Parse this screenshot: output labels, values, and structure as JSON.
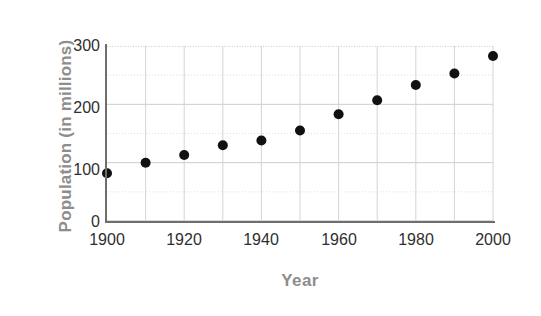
{
  "chart_data": {
    "type": "scatter",
    "title": "",
    "xlabel": "Year",
    "ylabel": "Population (in millions)",
    "x": [
      1900,
      1910,
      1920,
      1930,
      1940,
      1950,
      1960,
      1970,
      1980,
      1990,
      2000
    ],
    "values": [
      82,
      100,
      113,
      130,
      138,
      155,
      183,
      207,
      233,
      253,
      283
    ],
    "series": [
      {
        "name": "Population",
        "values": [
          82,
          100,
          113,
          130,
          138,
          155,
          183,
          207,
          233,
          253,
          283
        ]
      }
    ],
    "xlim": [
      1900,
      2000
    ],
    "ylim": [
      0,
      300
    ],
    "xticks": [
      1900,
      1920,
      1940,
      1960,
      1980,
      2000
    ],
    "xticklabels": [
      "1900",
      "1920",
      "1940",
      "1960",
      "1980",
      "2000"
    ],
    "yticks": [
      0,
      100,
      200,
      300
    ],
    "yticklabels": [
      "0",
      "100",
      "200",
      "300"
    ],
    "x_minor_step": 10,
    "y_minor_step": 50,
    "grid": true,
    "grid_major_color": "#c9c9c9",
    "grid_minor_color": "#dedede",
    "legend": false,
    "legend_position": "none",
    "marker": "circle",
    "marker_color": "#111111",
    "marker_radius": 5,
    "axis_color": "#6e6e6e",
    "label_color": "#8d8d8d",
    "tick_color": "#2f2f2f",
    "background": "#ffffff"
  }
}
